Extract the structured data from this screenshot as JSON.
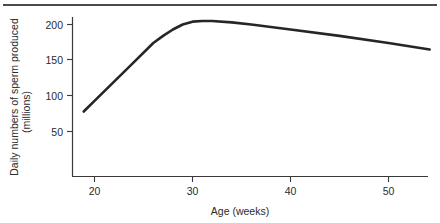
{
  "figure": {
    "background_color": "#ffffff",
    "rule_color": "#4a4a4a",
    "axis_color": "#3a3a3a",
    "line_color": "#262626"
  },
  "chart_data": {
    "type": "line",
    "title": "",
    "xlabel": "Age (weeks)",
    "ylabel": "Daily numbers of sperm produced",
    "ylabel_line2": "(millions)",
    "xlim": [
      17,
      55.5
    ],
    "ylim": [
      0,
      213
    ],
    "grid": false,
    "legend": null,
    "xticks": [
      20,
      30,
      40,
      50
    ],
    "xticklabels": [
      "20",
      "30",
      "40",
      "50"
    ],
    "yticks": [
      50,
      100,
      150,
      200
    ],
    "yticklabels": [
      "50",
      "100",
      "150",
      "200"
    ],
    "series": [
      {
        "name": "Daily sperm production",
        "x": [
          18.9,
          20.0,
          22.0,
          24.0,
          26.0,
          27.0,
          28.0,
          29.0,
          30.0,
          31.0,
          32.0,
          34.0,
          36.0,
          40.0,
          45.0,
          50.0,
          54.2
        ],
        "values": [
          78,
          93,
          120,
          147,
          174,
          184,
          193,
          200,
          204,
          205,
          205,
          203,
          200,
          193,
          184,
          174,
          165
        ]
      }
    ]
  }
}
